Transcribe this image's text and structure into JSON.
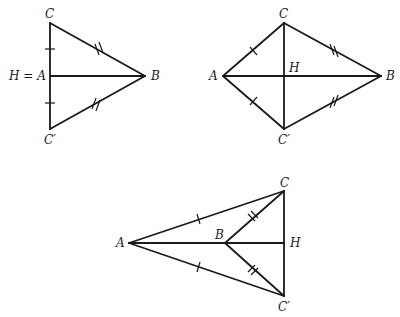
{
  "figures": [
    {
      "id": "degenerate",
      "labels": {
        "C": "C",
        "HA": "H = A",
        "B": "B",
        "Cp": "C′"
      },
      "points": {
        "C": [
          50,
          23
        ],
        "A": [
          50,
          76
        ],
        "Cp": [
          50,
          129
        ],
        "B": [
          145,
          76
        ]
      },
      "segments": [
        [
          "C",
          "Cp"
        ],
        [
          "A",
          "B"
        ],
        [
          "C",
          "B"
        ],
        [
          "Cp",
          "B"
        ]
      ]
    },
    {
      "id": "kite",
      "labels": {
        "C": "C",
        "A": "A",
        "H": "H",
        "B": "B",
        "Cp": "C′"
      },
      "points": {
        "C": [
          284,
          23
        ],
        "A": [
          223,
          76
        ],
        "H": [
          284,
          76
        ],
        "Cp": [
          284,
          129
        ],
        "B": [
          381,
          76
        ]
      },
      "segments": [
        [
          "A",
          "C"
        ],
        [
          "C",
          "B"
        ],
        [
          "A",
          "Cp"
        ],
        [
          "Cp",
          "B"
        ],
        [
          "A",
          "B"
        ],
        [
          "C",
          "Cp"
        ]
      ]
    },
    {
      "id": "dart",
      "labels": {
        "C": "C",
        "A": "A",
        "B": "B",
        "H": "H",
        "Cp": "C′"
      },
      "points": {
        "C": [
          284,
          191
        ],
        "A": [
          129,
          243
        ],
        "B": [
          225,
          243
        ],
        "H": [
          284,
          243
        ],
        "Cp": [
          284,
          296
        ]
      },
      "segments": [
        [
          "A",
          "C"
        ],
        [
          "A",
          "Cp"
        ],
        [
          "B",
          "C"
        ],
        [
          "B",
          "Cp"
        ],
        [
          "A",
          "H"
        ],
        [
          "C",
          "Cp"
        ]
      ]
    }
  ]
}
